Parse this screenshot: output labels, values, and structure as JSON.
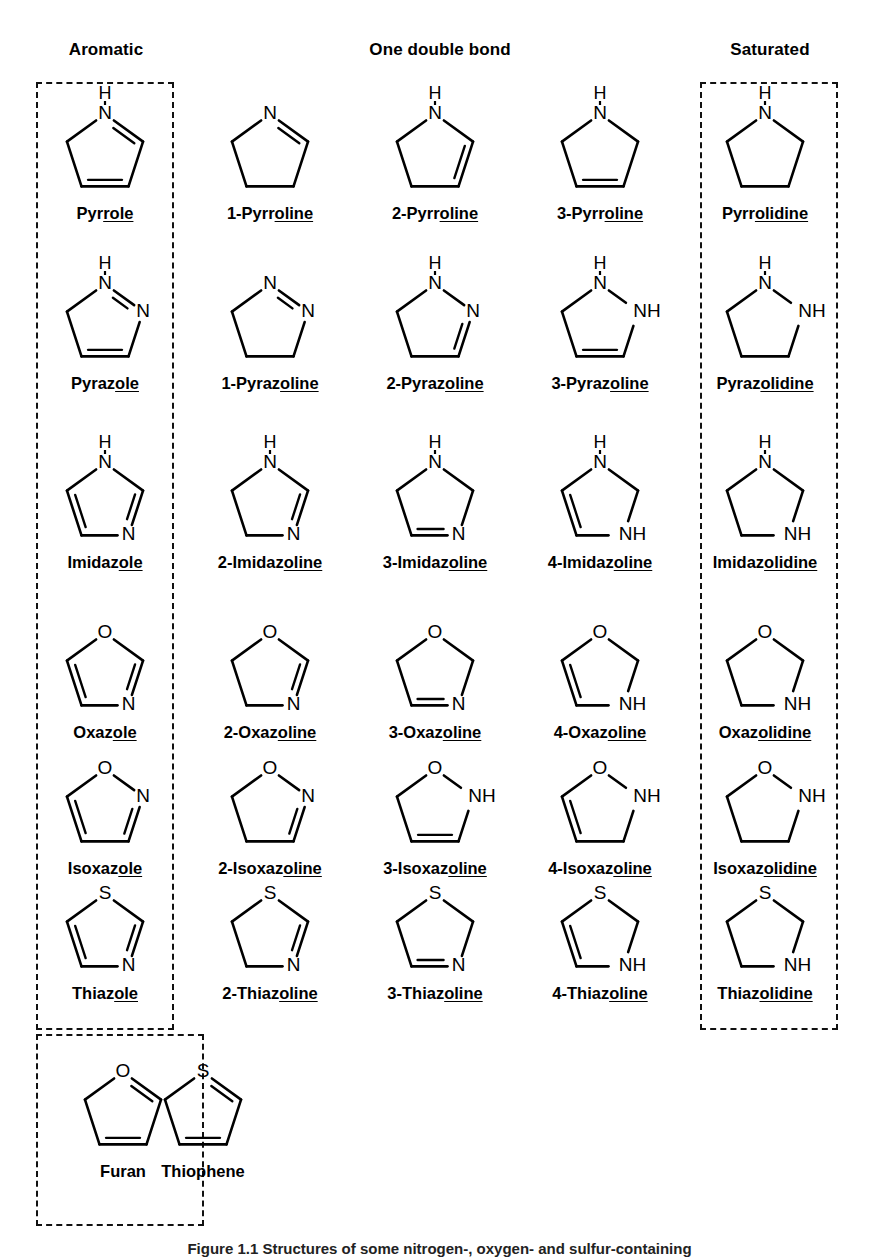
{
  "headers": [
    {
      "label": "Aromatic",
      "x": 36,
      "y": 40,
      "width": 140
    },
    {
      "label": "One double bond",
      "x": 330,
      "y": 40,
      "width": 220
    },
    {
      "label": "Saturated",
      "x": 700,
      "y": 40,
      "width": 140
    }
  ],
  "group_boxes": [
    {
      "name": "aromatic-box",
      "x": 36,
      "y": 82,
      "w": 138,
      "h": 948
    },
    {
      "name": "saturated-box",
      "x": 700,
      "y": 82,
      "w": 138,
      "h": 948
    },
    {
      "name": "extra-aromatic-box",
      "x": 36,
      "y": 1034,
      "w": 168,
      "h": 192
    }
  ],
  "columns": [
    {
      "index": 0,
      "center_x": 105,
      "kind": "aromatic"
    },
    {
      "index": 1,
      "center_x": 270,
      "kind": "one-double-bond"
    },
    {
      "index": 2,
      "center_x": 435,
      "kind": "one-double-bond"
    },
    {
      "index": 3,
      "center_x": 600,
      "kind": "one-double-bond"
    },
    {
      "index": 4,
      "center_x": 765,
      "kind": "saturated"
    }
  ],
  "rows": [
    {
      "family": "pyrrole",
      "top": 88
    },
    {
      "family": "pyrazole",
      "top": 258
    },
    {
      "family": "imidazole",
      "top": 437
    },
    {
      "family": "oxazole",
      "top": 607
    },
    {
      "family": "isoxazole",
      "top": 743
    },
    {
      "family": "thiazole",
      "top": 868
    }
  ],
  "molecules": [
    {
      "id": "pyrrole",
      "row": 0,
      "col": 0,
      "label": "Pyrrole",
      "label_plain": "Pyrrole",
      "label_parts": [
        {
          "t": "Pyr",
          "u": false
        },
        {
          "t": "role",
          "u": true
        }
      ],
      "atoms": {
        "v1": "N",
        "v2": "",
        "v3": "",
        "v4": "",
        "v5": ""
      },
      "nh_top": true,
      "double_bonds": [
        "v1-v2",
        "v3-v4"
      ],
      "aromatic": true
    },
    {
      "id": "1-pyrroline",
      "row": 0,
      "col": 1,
      "label": "1-Pyrroline",
      "label_parts": [
        {
          "t": "1-Pyrr",
          "u": false
        },
        {
          "t": "oline",
          "u": true
        }
      ],
      "atoms": {
        "v1": "N"
      },
      "nh_top": false,
      "double_bonds": [
        "v1-v2"
      ]
    },
    {
      "id": "2-pyrroline",
      "row": 0,
      "col": 2,
      "label": "2-Pyrroline",
      "label_parts": [
        {
          "t": "2-Pyrr",
          "u": false
        },
        {
          "t": "oline",
          "u": true
        }
      ],
      "atoms": {
        "v1": "N"
      },
      "nh_top": true,
      "double_bonds": [
        "v2-v3"
      ]
    },
    {
      "id": "3-pyrroline",
      "row": 0,
      "col": 3,
      "label": "3-Pyrroline",
      "label_parts": [
        {
          "t": "3-Pyrr",
          "u": false
        },
        {
          "t": "oline",
          "u": true
        }
      ],
      "atoms": {
        "v1": "N"
      },
      "nh_top": true,
      "double_bonds": [
        "v3-v4"
      ]
    },
    {
      "id": "pyrrolidine",
      "row": 0,
      "col": 4,
      "label": "Pyrrolidine",
      "label_parts": [
        {
          "t": "Pyrr",
          "u": false
        },
        {
          "t": "olidine",
          "u": true
        }
      ],
      "atoms": {
        "v1": "N"
      },
      "nh_top": true,
      "double_bonds": []
    },
    {
      "id": "pyrazole",
      "row": 1,
      "col": 0,
      "label": "Pyrazole",
      "label_parts": [
        {
          "t": "Pyraz",
          "u": false
        },
        {
          "t": "ole",
          "u": true
        }
      ],
      "atoms": {
        "v1": "N",
        "v2": "N"
      },
      "nh_top": true,
      "double_bonds": [
        "v1-v2",
        "v3-v4"
      ],
      "aromatic": true
    },
    {
      "id": "1-pyrazoline",
      "row": 1,
      "col": 1,
      "label": "1-Pyrazoline",
      "label_parts": [
        {
          "t": "1-Pyraz",
          "u": false
        },
        {
          "t": "oline",
          "u": true
        }
      ],
      "atoms": {
        "v1": "N",
        "v2": "N"
      },
      "nh_top": false,
      "double_bonds": [
        "v1-v2"
      ]
    },
    {
      "id": "2-pyrazoline",
      "row": 1,
      "col": 2,
      "label": "2-Pyrazoline",
      "label_parts": [
        {
          "t": "2-Pyraz",
          "u": false
        },
        {
          "t": "oline",
          "u": true
        }
      ],
      "atoms": {
        "v1": "N",
        "v2": "N"
      },
      "nh_top": true,
      "double_bonds": [
        "v2-v3"
      ]
    },
    {
      "id": "3-pyrazoline",
      "row": 1,
      "col": 3,
      "label": "3-Pyrazoline",
      "label_parts": [
        {
          "t": "3-Pyraz",
          "u": false
        },
        {
          "t": "oline",
          "u": true
        }
      ],
      "atoms": {
        "v1": "N",
        "v2": "NH"
      },
      "nh_top": true,
      "double_bonds": [
        "v3-v4"
      ]
    },
    {
      "id": "pyrazolidine",
      "row": 1,
      "col": 4,
      "label": "Pyrazolidine",
      "label_parts": [
        {
          "t": "Pyraz",
          "u": false
        },
        {
          "t": "olidine",
          "u": true
        }
      ],
      "atoms": {
        "v1": "N",
        "v2": "NH"
      },
      "nh_top": true,
      "double_bonds": []
    },
    {
      "id": "imidazole",
      "row": 2,
      "col": 0,
      "label": "Imidazole",
      "label_parts": [
        {
          "t": "Imidaz",
          "u": false
        },
        {
          "t": "ole",
          "u": true
        }
      ],
      "atoms": {
        "v1": "N",
        "v3": "N"
      },
      "nh_top": true,
      "double_bonds": [
        "v2-v3",
        "v4-v5"
      ],
      "aromatic": true
    },
    {
      "id": "2-imidazoline",
      "row": 2,
      "col": 1,
      "label": "2-Imidazoline",
      "label_parts": [
        {
          "t": "2-Imidaz",
          "u": false
        },
        {
          "t": "oline",
          "u": true
        }
      ],
      "atoms": {
        "v1": "N",
        "v3": "N"
      },
      "nh_top": true,
      "double_bonds": [
        "v2-v3"
      ]
    },
    {
      "id": "3-imidazoline",
      "row": 2,
      "col": 2,
      "label": "3-Imidazoline",
      "label_parts": [
        {
          "t": "3-Imidaz",
          "u": false
        },
        {
          "t": "oline",
          "u": true
        }
      ],
      "atoms": {
        "v1": "N",
        "v3": "N"
      },
      "nh_top": true,
      "double_bonds": [
        "v3-v4"
      ]
    },
    {
      "id": "4-imidazoline",
      "row": 2,
      "col": 3,
      "label": "4-Imidazoline",
      "label_parts": [
        {
          "t": "4-Imidaz",
          "u": false
        },
        {
          "t": "oline",
          "u": true
        }
      ],
      "atoms": {
        "v1": "N",
        "v3": "NH"
      },
      "nh_top": true,
      "double_bonds": [
        "v4-v5"
      ]
    },
    {
      "id": "imidazolidine",
      "row": 2,
      "col": 4,
      "label": "Imidazolidine",
      "label_parts": [
        {
          "t": "Imidaz",
          "u": false
        },
        {
          "t": "olidine",
          "u": true
        }
      ],
      "atoms": {
        "v1": "N",
        "v3": "NH"
      },
      "nh_top": true,
      "double_bonds": []
    },
    {
      "id": "oxazole",
      "row": 3,
      "col": 0,
      "label": "Oxazole",
      "label_parts": [
        {
          "t": "Oxaz",
          "u": false
        },
        {
          "t": "ole",
          "u": true
        }
      ],
      "atoms": {
        "v1": "O",
        "v3": "N"
      },
      "nh_top": false,
      "double_bonds": [
        "v2-v3",
        "v4-v5"
      ],
      "aromatic": true
    },
    {
      "id": "2-oxazoline",
      "row": 3,
      "col": 1,
      "label": "2-Oxazoline",
      "label_parts": [
        {
          "t": "2-Oxaz",
          "u": false
        },
        {
          "t": "oline",
          "u": true
        }
      ],
      "atoms": {
        "v1": "O",
        "v3": "N"
      },
      "nh_top": false,
      "double_bonds": [
        "v2-v3"
      ]
    },
    {
      "id": "3-oxazoline",
      "row": 3,
      "col": 2,
      "label": "3-Oxazoline",
      "label_parts": [
        {
          "t": "3-Oxaz",
          "u": false
        },
        {
          "t": "oline",
          "u": true
        }
      ],
      "atoms": {
        "v1": "O",
        "v3": "N"
      },
      "nh_top": false,
      "double_bonds": [
        "v3-v4"
      ]
    },
    {
      "id": "4-oxazoline",
      "row": 3,
      "col": 3,
      "label": "4-Oxazoline",
      "label_parts": [
        {
          "t": "4-Oxaz",
          "u": false
        },
        {
          "t": "oline",
          "u": true
        }
      ],
      "atoms": {
        "v1": "O",
        "v3": "NH"
      },
      "nh_top": false,
      "double_bonds": [
        "v4-v5"
      ]
    },
    {
      "id": "oxazolidine",
      "row": 3,
      "col": 4,
      "label": "Oxazolidine",
      "label_parts": [
        {
          "t": "Oxaz",
          "u": false
        },
        {
          "t": "olidine",
          "u": true
        }
      ],
      "atoms": {
        "v1": "O",
        "v3": "NH"
      },
      "nh_top": false,
      "double_bonds": []
    },
    {
      "id": "isoxazole",
      "row": 4,
      "col": 0,
      "label": "Isoxazole",
      "label_parts": [
        {
          "t": "Isoxaz",
          "u": false
        },
        {
          "t": "ole",
          "u": true
        }
      ],
      "atoms": {
        "v1": "O",
        "v2": "N"
      },
      "nh_top": false,
      "double_bonds": [
        "v2-v3",
        "v4-v5"
      ],
      "aromatic": true
    },
    {
      "id": "2-isoxazoline",
      "row": 4,
      "col": 1,
      "label": "2-Isoxazoline",
      "label_parts": [
        {
          "t": "2-Isoxaz",
          "u": false
        },
        {
          "t": "oline",
          "u": true
        }
      ],
      "atoms": {
        "v1": "O",
        "v2": "N"
      },
      "nh_top": false,
      "double_bonds": [
        "v2-v3"
      ]
    },
    {
      "id": "3-isoxazoline",
      "row": 4,
      "col": 2,
      "label": "3-Isoxazoline",
      "label_parts": [
        {
          "t": "3-Isoxaz",
          "u": false
        },
        {
          "t": "oline",
          "u": true
        }
      ],
      "atoms": {
        "v1": "O",
        "v2": "NH"
      },
      "nh_top": false,
      "double_bonds": [
        "v3-v4"
      ]
    },
    {
      "id": "4-isoxazoline",
      "row": 4,
      "col": 3,
      "label": "4-Isoxazoline",
      "label_parts": [
        {
          "t": "4-Isoxaz",
          "u": false
        },
        {
          "t": "oline",
          "u": true
        }
      ],
      "atoms": {
        "v1": "O",
        "v2": "NH"
      },
      "nh_top": false,
      "double_bonds": [
        "v4-v5"
      ]
    },
    {
      "id": "isoxazolidine",
      "row": 4,
      "col": 4,
      "label": "Isoxazolidine",
      "label_parts": [
        {
          "t": "Isoxaz",
          "u": false
        },
        {
          "t": "olidine",
          "u": true
        }
      ],
      "atoms": {
        "v1": "O",
        "v2": "NH"
      },
      "nh_top": false,
      "double_bonds": []
    },
    {
      "id": "thiazole",
      "row": 5,
      "col": 0,
      "label": "Thiazole",
      "label_parts": [
        {
          "t": "Thiaz",
          "u": false
        },
        {
          "t": "ole",
          "u": true
        }
      ],
      "atoms": {
        "v1": "S",
        "v3": "N"
      },
      "nh_top": false,
      "double_bonds": [
        "v2-v3",
        "v4-v5"
      ],
      "aromatic": true
    },
    {
      "id": "2-thiazoline",
      "row": 5,
      "col": 1,
      "label": "2-Thiazoline",
      "label_parts": [
        {
          "t": "2-Thiaz",
          "u": false
        },
        {
          "t": "oline",
          "u": true
        }
      ],
      "atoms": {
        "v1": "S",
        "v3": "N"
      },
      "nh_top": false,
      "double_bonds": [
        "v2-v3"
      ]
    },
    {
      "id": "3-thiazoline",
      "row": 5,
      "col": 2,
      "label": "3-Thiazoline",
      "label_parts": [
        {
          "t": "3-Thiaz",
          "u": false
        },
        {
          "t": "oline",
          "u": true
        }
      ],
      "atoms": {
        "v1": "S",
        "v3": "N"
      },
      "nh_top": false,
      "double_bonds": [
        "v3-v4"
      ]
    },
    {
      "id": "4-thiazoline",
      "row": 5,
      "col": 3,
      "label": "4-Thiazoline",
      "label_parts": [
        {
          "t": "4-Thiaz",
          "u": false
        },
        {
          "t": "oline",
          "u": true
        }
      ],
      "atoms": {
        "v1": "S",
        "v3": "NH"
      },
      "nh_top": false,
      "double_bonds": [
        "v4-v5"
      ]
    },
    {
      "id": "thiazolidine",
      "row": 5,
      "col": 4,
      "label": "Thiazolidine",
      "label_parts": [
        {
          "t": "Thiaz",
          "u": false
        },
        {
          "t": "olidine",
          "u": true
        }
      ],
      "atoms": {
        "v1": "S",
        "v3": "NH"
      },
      "nh_top": false,
      "double_bonds": []
    },
    {
      "id": "furan",
      "row": 6,
      "col": 0,
      "label": "Furan",
      "label_parts": [
        {
          "t": "Furan",
          "u": false
        }
      ],
      "atoms": {
        "v1": "O"
      },
      "nh_top": false,
      "double_bonds": [
        "v1-v2",
        "v3-v4"
      ],
      "aromatic": true,
      "abs_left": 38,
      "abs_top": 1046
    },
    {
      "id": "thiophene",
      "row": 6,
      "col": 1,
      "label": "Thiophene",
      "label_parts": [
        {
          "t": "Thiophene",
          "u": false
        }
      ],
      "atoms": {
        "v1": "S"
      },
      "nh_top": false,
      "double_bonds": [
        "v1-v2",
        "v3-v4"
      ],
      "aromatic": true,
      "abs_left": 118,
      "abs_top": 1046
    }
  ],
  "caption": {
    "text": "Figure 1.1  Structures of some nitrogen-, oxygen- and sulfur-containing",
    "y": 1240
  }
}
